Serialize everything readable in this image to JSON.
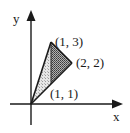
{
  "diagram": {
    "axes": {
      "x_label": "x",
      "y_label": "y"
    },
    "points": [
      {
        "name": "origin",
        "label": "",
        "x": 0,
        "y": 0
      },
      {
        "name": "apex",
        "label": "(1, 3)",
        "x": 1,
        "y": 3
      },
      {
        "name": "right",
        "label": "(2, 2)",
        "x": 2,
        "y": 2
      },
      {
        "name": "bottom",
        "label": "(1, 1)",
        "x": 1,
        "y": 1
      }
    ],
    "regions": [
      {
        "name": "left-triangle",
        "vertices": [
          "(0, 0)",
          "(1, 3)",
          "(1, 1)"
        ],
        "fill": "light stipple"
      },
      {
        "name": "right-triangle",
        "vertices": [
          "(1, 3)",
          "(2, 2)",
          "(1, 1)"
        ],
        "fill": "dark crosshatch"
      }
    ],
    "colors": {
      "line": "#1a1a1a",
      "light_fill": "#d9d9d9",
      "dark_fill": "#8a8a8a",
      "background": "#ffffff"
    }
  }
}
